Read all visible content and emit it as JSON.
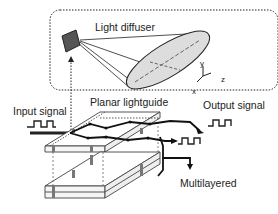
{
  "diagram": {
    "labels": {
      "light_diffuser": "Light diffuser",
      "input_signal": "Input signal",
      "planar_lightguide": "Planar lightguide",
      "output_signal": "Output signal",
      "multilayered": "Multilayered"
    },
    "axes": {
      "x": "x",
      "y": "y",
      "z": "z"
    },
    "colors": {
      "stroke": "#222222",
      "ellipse_fill": "#dddddd",
      "diffuser_fill": "#555555",
      "background": "#ffffff"
    }
  }
}
